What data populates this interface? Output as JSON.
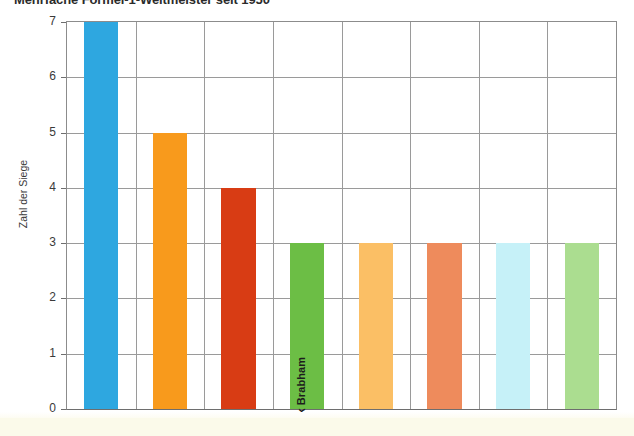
{
  "chart_data": {
    "type": "bar",
    "title": "Mehrfache Formel-1-Weltmeister seit 1950",
    "xlabel": "",
    "ylabel": "Zahl der Siege",
    "ylim": [
      0,
      7
    ],
    "yticks": [
      "0",
      "1",
      "2",
      "3",
      "4",
      "5",
      "6",
      "7"
    ],
    "grid": true,
    "legend": "none",
    "categories": [
      "",
      "",
      "",
      "Jack Brabham",
      "",
      "",
      "",
      ""
    ],
    "values": [
      7,
      5,
      4,
      3,
      3,
      3,
      3,
      3
    ],
    "bar_colors": [
      "#2ea7e0",
      "#f89a1c",
      "#d83c14",
      "#6cbe45",
      "#fbbf65",
      "#ee8b5c",
      "#c6f1f8",
      "#abdd90"
    ],
    "bar_labels": [
      "",
      "",
      "",
      "Jack Brabham",
      "",
      "",
      "",
      ""
    ],
    "annotations": []
  },
  "axis": {
    "y_title": "Zahl der Siege",
    "tick_0": "0",
    "tick_1": "1",
    "tick_2": "2",
    "tick_3": "3",
    "tick_4": "4",
    "tick_5": "5",
    "tick_6": "6",
    "tick_7": "7"
  },
  "header": {
    "title": "Mehrfache Formel-1-Weltmeister seit 1950"
  },
  "colors": {
    "grid": "#9a9a9a",
    "axis": "#6e6e6e",
    "text": "#3a3a3a",
    "band": "#fbfaea"
  }
}
